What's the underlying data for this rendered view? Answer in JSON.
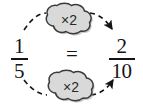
{
  "figure": {
    "background_color": "#ffffff",
    "ink_color": "#141414",
    "cloud_fill_color": "#d9d9d9",
    "cloud_stroke_color": "#3b3b3b",
    "cloud_shadow_color": "#9a9a9a"
  },
  "left_fraction": {
    "numerator": "1",
    "denominator": "5"
  },
  "right_fraction": {
    "numerator": "2",
    "denominator": "10"
  },
  "relation": {
    "symbol": "="
  },
  "operations": [
    {
      "id": "top",
      "label": "×2",
      "applies_to": "numerator",
      "from": "1",
      "to": "2"
    },
    {
      "id": "bottom",
      "label": "×2",
      "applies_to": "denominator",
      "from": "5",
      "to": "10"
    }
  ],
  "arrows": [
    {
      "id": "top-arrow",
      "style": "dashed",
      "direction": "left-to-right"
    },
    {
      "id": "bottom-arrow",
      "style": "dashed",
      "direction": "left-to-right"
    }
  ]
}
